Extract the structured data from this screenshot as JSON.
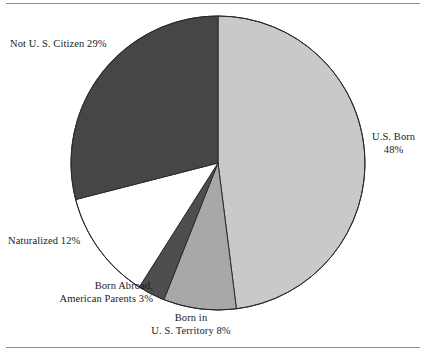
{
  "chart_data": {
    "type": "pie",
    "title": "",
    "subtitle": "",
    "legend_position": "labels-around-pie",
    "grid": false,
    "start_angle_deg": 0,
    "direction": "clockwise",
    "center": {
      "x": 218,
      "y": 163
    },
    "radius": 147,
    "categories": [
      "U.S. Born",
      "Born in U. S. Territory",
      "Born Abroad, American Parents",
      "Naturalized",
      "Not U. S. Citizen"
    ],
    "values": [
      48,
      8,
      3,
      12,
      29
    ],
    "units": "percent",
    "slices": [
      {
        "name": "us-born",
        "label_lines": [
          "U.S. Born",
          "48%"
        ],
        "value": 48,
        "color": "#c9c9c9",
        "start_deg": 0,
        "end_deg": 172.8
      },
      {
        "name": "born-in-us-territory",
        "label_lines": [
          "Born in",
          "U. S. Territory 8%"
        ],
        "value": 8,
        "color": "#a8a8a8",
        "start_deg": 172.8,
        "end_deg": 201.6
      },
      {
        "name": "born-abroad-american-parents",
        "label_lines": [
          "Born Abroad,",
          "American Parents 3%"
        ],
        "value": 3,
        "color": "#4e4e4e",
        "start_deg": 201.6,
        "end_deg": 212.4
      },
      {
        "name": "naturalized",
        "label_lines": [
          "Naturalized 12%"
        ],
        "value": 12,
        "color": "#ffffff",
        "start_deg": 212.4,
        "end_deg": 255.6
      },
      {
        "name": "not-us-citizen",
        "label_lines": [
          "Not U. S. Citizen 29%"
        ],
        "value": 29,
        "color": "#464646",
        "start_deg": 255.6,
        "end_deg": 360
      }
    ],
    "outline_color": "#2b2b2b",
    "rule_color": "#8d8d8d"
  },
  "labels": {
    "not_us_citizen": "Not U. S. Citizen 29%",
    "us_born_line1": "U.S. Born",
    "us_born_line2": "48%",
    "naturalized": "Naturalized 12%",
    "born_abroad_line1": "Born Abroad,",
    "born_abroad_line2": "American Parents 3%",
    "us_territory_line1": "Born in",
    "us_territory_line2": "U. S. Territory 8%"
  }
}
